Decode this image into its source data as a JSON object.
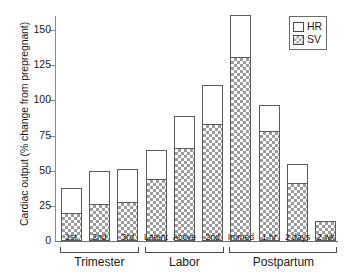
{
  "chart_data": {
    "type": "bar",
    "stacked": true,
    "title": "",
    "xlabel": "",
    "ylabel": "Cardiac output (% change from prepregnant)",
    "ylim": [
      0,
      160
    ],
    "yticks": [
      0,
      25,
      50,
      75,
      100,
      125,
      150
    ],
    "ytick_labels": [
      "0",
      "25",
      "50",
      "75",
      "100",
      "125",
      "150"
    ],
    "grid": false,
    "categories": [
      "1st",
      "2nd",
      "3rd",
      "Latent",
      "Active",
      "2nd",
      "Immed",
      "1 hr",
      "2 days",
      "2 wk"
    ],
    "series": [
      {
        "name": "SV",
        "values": [
          20,
          26,
          28,
          44,
          66,
          83,
          131,
          78,
          41,
          14
        ]
      },
      {
        "name": "HR",
        "values": [
          18,
          24,
          23,
          21,
          23,
          28,
          30,
          19,
          14,
          0
        ]
      }
    ],
    "totals": [
      38,
      50,
      51,
      65,
      89,
      111,
      161,
      97,
      55,
      14
    ],
    "legend": {
      "position": "top-right",
      "entries": [
        {
          "label": "HR",
          "swatch": "open-white"
        },
        {
          "label": "SV",
          "swatch": "checkered-gray"
        }
      ]
    },
    "groups": [
      {
        "label": "Trimester",
        "start_index": 0,
        "end_index": 2
      },
      {
        "label": "Labor",
        "start_index": 3,
        "end_index": 5
      },
      {
        "label": "Postpartum",
        "start_index": 6,
        "end_index": 9
      }
    ]
  }
}
